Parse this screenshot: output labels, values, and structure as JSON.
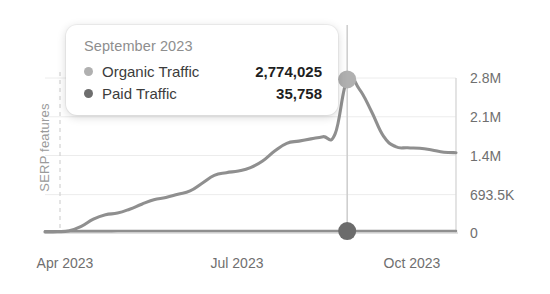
{
  "chart_data": {
    "type": "line",
    "title": "",
    "xlabel": "",
    "ylabel": "SERP features",
    "grid": true,
    "legend_position": "tooltip",
    "x_tick_labels": [
      "Apr 2023",
      "Jul 2023",
      "Oct 2023"
    ],
    "y_tick_labels": [
      "2.8M",
      "2.1M",
      "1.4M",
      "693.5K",
      "0"
    ],
    "y_tick_values": [
      2800000,
      2100000,
      1400000,
      693500,
      0
    ],
    "ylim": [
      0,
      2800000
    ],
    "series": [
      {
        "name": "Organic Traffic",
        "color": "#8f8f8f",
        "values": [
          18000,
          22000,
          40000,
          120000,
          250000,
          330000,
          360000,
          430000,
          520000,
          600000,
          640000,
          700000,
          760000,
          900000,
          1040000,
          1090000,
          1120000,
          1180000,
          1300000,
          1480000,
          1620000,
          1660000,
          1700000,
          1740000,
          1790000,
          2774025,
          2600000,
          2200000,
          1750000,
          1560000,
          1540000,
          1530000,
          1500000,
          1460000,
          1450000
        ]
      },
      {
        "name": "Paid Traffic",
        "color": "#6b6b6b",
        "values": [
          30000,
          31000,
          32000,
          33000,
          34000,
          34500,
          35000,
          35100,
          35200,
          35300,
          35400,
          35450,
          35500,
          35550,
          35600,
          35620,
          35650,
          35670,
          35690,
          35700,
          35710,
          35720,
          35730,
          35740,
          35750,
          35758,
          35760,
          35755,
          35750,
          35745,
          35740,
          35735,
          35730,
          35725,
          35720
        ]
      }
    ],
    "highlight": {
      "x_index": 25,
      "label": "September 2023"
    }
  },
  "tooltip": {
    "title": "September 2023",
    "rows": [
      {
        "label": "Organic Traffic",
        "value": "2,774,025",
        "dot_color": "#b0b0b0"
      },
      {
        "label": "Paid Traffic",
        "value": "35,758",
        "dot_color": "#6e6e6e"
      }
    ]
  },
  "axes": {
    "y_title": "SERP features",
    "y_ticks": [
      "2.8M",
      "2.1M",
      "1.4M",
      "693.5K",
      "0"
    ],
    "x_ticks": [
      "Apr 2023",
      "Jul 2023",
      "Oct 2023"
    ]
  },
  "colors": {
    "organic_line": "#8f8f8f",
    "paid_line": "#8f8f8f",
    "organic_marker": "#b0b0b0",
    "paid_marker": "#6b6b6b",
    "grid": "#ececec",
    "axis": "#d8d8d8",
    "hover_line": "#cfcfcf",
    "dashed_line": "#d2d2d2",
    "text": "#6f6f6f",
    "background": "#ffffff"
  }
}
